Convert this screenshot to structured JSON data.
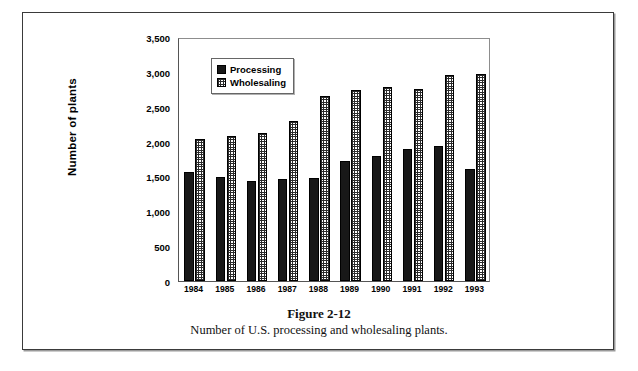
{
  "figure": {
    "number": "Figure 2-12",
    "caption": "Number of U.S. processing and wholesaling plants."
  },
  "legend": {
    "position": "top-left-inside",
    "items": [
      {
        "label": "Processing",
        "swatch": "solid-black-swatch",
        "color": "#181818"
      },
      {
        "label": "Wholesaling",
        "swatch": "crosshatch-grid-swatch",
        "color": "#2b2b2b"
      }
    ]
  },
  "chart_data": {
    "type": "bar",
    "title": "",
    "subtitle": "",
    "xlabel": "",
    "ylabel": "Number of plants",
    "ylim": [
      0,
      3500
    ],
    "ytick_labels": [
      "0",
      "500",
      "1,000",
      "1,500",
      "2,000",
      "2,500",
      "3,000",
      "3,500"
    ],
    "ytick_values": [
      0,
      500,
      1000,
      1500,
      2000,
      2500,
      3000,
      3500
    ],
    "grid": false,
    "legend_position": "upper left (inside axes)",
    "categories": [
      "1984",
      "1985",
      "1986",
      "1987",
      "1988",
      "1989",
      "1990",
      "1991",
      "1992",
      "1993"
    ],
    "series": [
      {
        "name": "Processing",
        "color": "#181818",
        "fill": "solid",
        "values": [
          1570,
          1490,
          1430,
          1460,
          1480,
          1720,
          1800,
          1890,
          1940,
          1600
        ]
      },
      {
        "name": "Wholesaling",
        "color": "#2b2b2b",
        "fill": "crosshatch",
        "values": [
          2040,
          2080,
          2130,
          2300,
          2660,
          2740,
          2780,
          2750,
          2960,
          2965
        ]
      }
    ]
  }
}
